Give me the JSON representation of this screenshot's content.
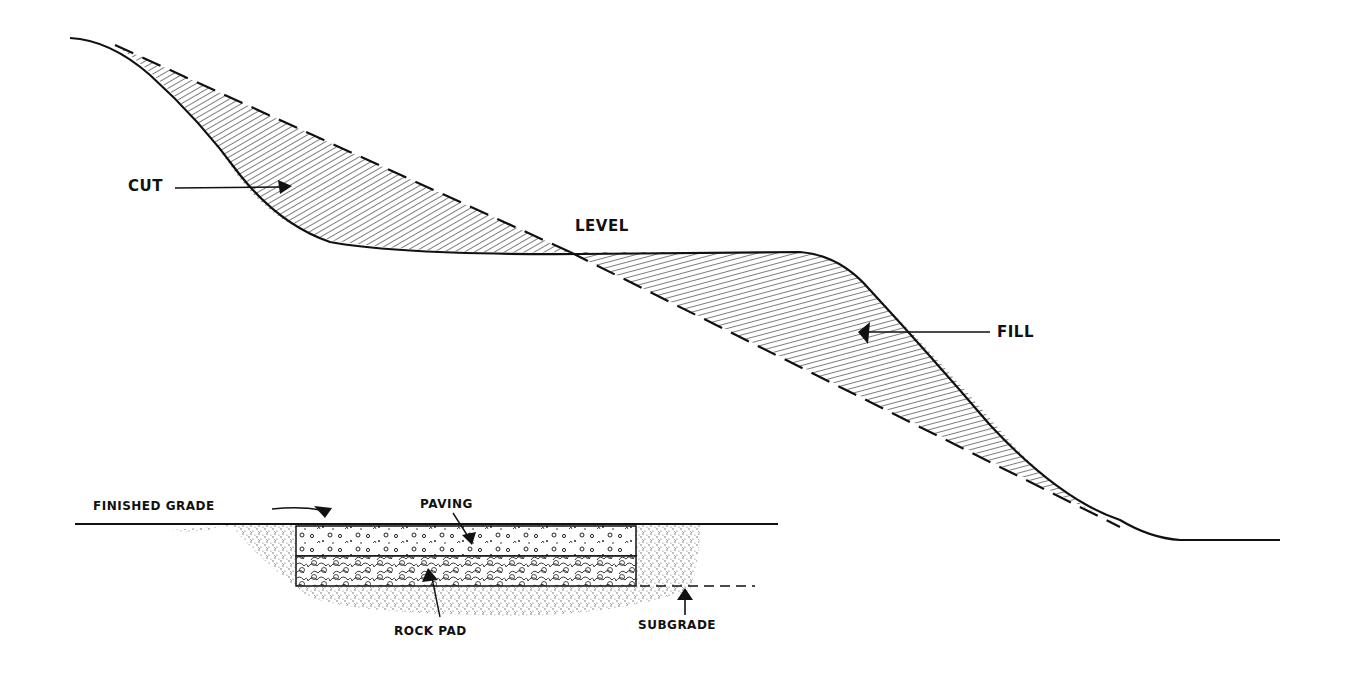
{
  "diagram": {
    "top": {
      "labels": {
        "cut": "CUT",
        "level": "LEVEL",
        "fill": "FILL"
      }
    },
    "bottom": {
      "labels": {
        "finished_grade": "FINISHED GRADE",
        "paving": "PAVING",
        "rock_pad": "ROCK PAD",
        "subgrade": "SUBGRADE"
      }
    },
    "colors": {
      "ink": "#111111",
      "background": "#ffffff"
    }
  }
}
